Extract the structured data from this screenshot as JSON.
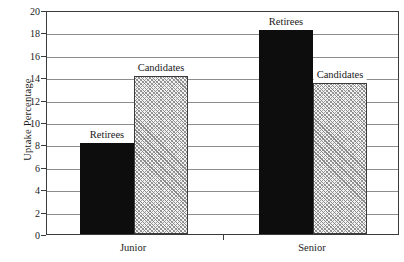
{
  "chart_data": {
    "type": "bar",
    "title": "",
    "xlabel": "",
    "ylabel": "Uptake Percentage",
    "categories": [
      "Junior",
      "Senior"
    ],
    "series": [
      {
        "name": "Retirees",
        "values": [
          8.1,
          18.2
        ]
      },
      {
        "name": "Candidates",
        "values": [
          14.1,
          13.5
        ]
      }
    ],
    "ylim": [
      0,
      20
    ],
    "ytick_labels": [
      "0",
      "2",
      "4",
      "6",
      "8",
      "10",
      "12",
      "14",
      "16",
      "18",
      "20"
    ],
    "ytick_values": [
      0,
      2,
      4,
      6,
      8,
      10,
      12,
      14,
      16,
      18,
      20
    ],
    "grid": true,
    "legend_position": "inline-annotations",
    "annotations": [
      {
        "text": "Retirees",
        "group": "Junior",
        "series": "Retirees"
      },
      {
        "text": "Candidates",
        "group": "Junior",
        "series": "Candidates"
      },
      {
        "text": "Retirees",
        "group": "Senior",
        "series": "Retirees"
      },
      {
        "text": "Candidates",
        "group": "Senior",
        "series": "Candidates"
      }
    ],
    "colors": {
      "retirees_fill": "#0d0d0d",
      "candidates_fill": "#f2f2f2",
      "candidates_hatch": "#8a8a8a",
      "axis": "#3b3b3b",
      "gridline": "#8d8d8d",
      "background": "#ffffff"
    }
  },
  "axis": {
    "y_title": "Uptake Percentage"
  }
}
